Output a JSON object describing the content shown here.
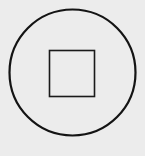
{
  "button": {
    "icon": "stop-icon",
    "label": "Stop",
    "colors": {
      "background": "#ececec",
      "stroke": "#141414"
    }
  }
}
